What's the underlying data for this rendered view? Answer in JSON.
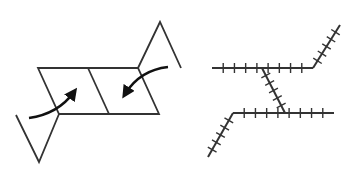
{
  "figure": {
    "width": 351,
    "height": 172,
    "background": "#ffffff",
    "stroke_color": "#333333",
    "arrow_color": "#111111"
  },
  "left_diagram": {
    "description": "Two-cell parallelogram with triangular flaps on opposite corners and curved arrows indicating folding inward",
    "parallelogram": {
      "points": [
        [
          38,
          68
        ],
        [
          138,
          68
        ],
        [
          159,
          114
        ],
        [
          59,
          114
        ]
      ]
    },
    "divider": {
      "from": [
        88,
        68
      ],
      "to": [
        109,
        114
      ]
    },
    "left_flap": {
      "points": [
        [
          16,
          115
        ],
        [
          39,
          162
        ],
        [
          59,
          114
        ]
      ]
    },
    "right_flap": {
      "points": [
        [
          138,
          68
        ],
        [
          160,
          22
        ],
        [
          181,
          68
        ]
      ]
    },
    "arrows": [
      {
        "name": "left-fold-arrow",
        "from": [
          29,
          118
        ],
        "ctrl": [
          58,
          114
        ],
        "to": [
          74,
          92
        ]
      },
      {
        "name": "right-fold-arrow",
        "from": [
          168,
          67
        ],
        "ctrl": [
          140,
          70
        ],
        "to": [
          125,
          94
        ]
      }
    ]
  },
  "right_diagram": {
    "description": "Hatched (tick-marked) line paths forming a Z-like fold pattern",
    "segments": [
      {
        "name": "top-horizontal",
        "from": [
          212,
          68
        ],
        "to": [
          313,
          68
        ],
        "ticks": 8
      },
      {
        "name": "top-right-diagonal",
        "from": [
          313,
          68
        ],
        "to": [
          340,
          25
        ],
        "ticks": 5
      },
      {
        "name": "middle-diagonal",
        "from": [
          262,
          68
        ],
        "to": [
          285,
          113
        ],
        "ticks": 5
      },
      {
        "name": "bottom-horizontal",
        "from": [
          233,
          113
        ],
        "to": [
          334,
          113
        ],
        "ticks": 8
      },
      {
        "name": "bottom-left-diagonal",
        "from": [
          233,
          113
        ],
        "to": [
          208,
          157
        ],
        "ticks": 5
      }
    ],
    "tick_length": 10
  }
}
